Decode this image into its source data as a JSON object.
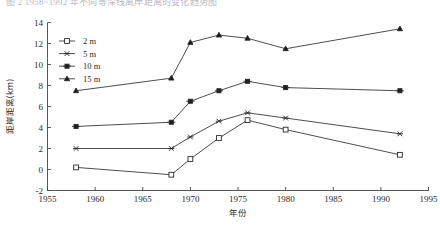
{
  "figure": {
    "truncated_caption": "图 2  1958~1992 年不同等深线离岸距离的变化趋势图",
    "background": "#ffffff",
    "line_color": "#3a3a3a"
  },
  "chart_data": {
    "type": "line",
    "title": "",
    "xlabel": "年份",
    "ylabel": "距岸距离(km)",
    "xlim": [
      1955,
      1995
    ],
    "ylim": [
      -2,
      14
    ],
    "xticks": [
      1955,
      1960,
      1965,
      1970,
      1975,
      1980,
      1985,
      1990,
      1995
    ],
    "xtick_labels": [
      "1955",
      "1960",
      "1965",
      "1970",
      "1975",
      "1980",
      "1985",
      "1990",
      "1995"
    ],
    "yticks": [
      -2,
      0,
      2,
      4,
      6,
      8,
      10,
      12,
      14
    ],
    "ytick_labels": [
      "-2",
      "0",
      "2",
      "4",
      "6",
      "8",
      "10",
      "12",
      "14"
    ],
    "grid": false,
    "legend_position": "upper-left-inside",
    "x": [
      1958,
      1968,
      1970,
      1973,
      1976,
      1980,
      1992
    ],
    "series": [
      {
        "name": "2 m",
        "marker": "open-square",
        "values": [
          0.2,
          -0.5,
          1.0,
          3.0,
          4.7,
          3.8,
          1.4
        ]
      },
      {
        "name": "5 m",
        "marker": "x-cross",
        "values": [
          2.0,
          2.0,
          3.1,
          4.6,
          5.4,
          4.9,
          3.4
        ]
      },
      {
        "name": "10 m",
        "marker": "filled-square",
        "values": [
          4.1,
          4.5,
          6.5,
          7.5,
          8.4,
          7.8,
          7.5
        ]
      },
      {
        "name": "15 m",
        "marker": "filled-triangle",
        "values": [
          7.5,
          8.7,
          12.1,
          12.8,
          12.5,
          11.5,
          13.4
        ]
      }
    ]
  }
}
